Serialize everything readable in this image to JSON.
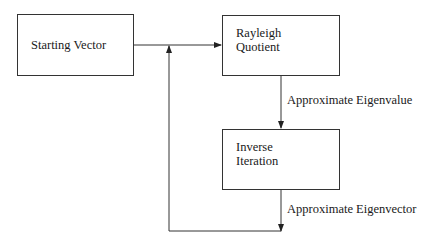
{
  "diagram": {
    "nodes": {
      "start": {
        "label": "Starting Vector"
      },
      "rayleigh": {
        "line1": "Rayleigh",
        "line2": "Quotient"
      },
      "inverse": {
        "line1": "Inverse",
        "line2": "Iteration"
      }
    },
    "edges": {
      "eigenvalue": {
        "label": "Approximate Eigenvalue"
      },
      "eigenvector": {
        "label": "Approximate Eigenvector"
      }
    },
    "colors": {
      "stroke": "#333333",
      "text": "#1a1a1a",
      "background": "#ffffff"
    }
  }
}
